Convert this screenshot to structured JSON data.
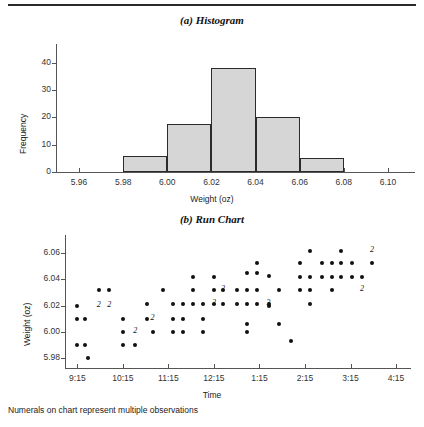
{
  "figure": {
    "caption": "Numerals on chart represent multiple observations"
  },
  "panel_a": {
    "title": "(a) Histogram"
  },
  "panel_b": {
    "title": "(b) Run Chart"
  },
  "chart_data": [
    {
      "type": "bar",
      "title": "(a) Histogram",
      "xlabel": "Weight (oz)",
      "ylabel": "Frequency",
      "xlim": [
        5.95,
        6.11
      ],
      "ylim": [
        0,
        44
      ],
      "xticks": [
        "5.96",
        "5.98",
        "6.00",
        "6.02",
        "6.04",
        "6.06",
        "6.08",
        "6.10"
      ],
      "xtick_values": [
        5.96,
        5.98,
        6.0,
        6.02,
        6.04,
        6.06,
        6.08,
        6.1
      ],
      "yticks": [
        "0",
        "10",
        "20",
        "30",
        "40"
      ],
      "ytick_values": [
        0,
        10,
        20,
        30,
        40
      ],
      "grid": false,
      "legend": "none",
      "bin_edges": [
        5.98,
        6.0,
        6.02,
        6.04,
        6.06,
        6.08
      ],
      "categories": [
        "5.98-6.00",
        "6.00-6.02",
        "6.02-6.04",
        "6.04-6.06",
        "6.06-6.08"
      ],
      "values": [
        6,
        17.5,
        38,
        20,
        5
      ]
    },
    {
      "type": "scatter",
      "title": "(b) Run Chart",
      "xlabel": "Time",
      "ylabel": "Weight (oz)",
      "xlim": [
        9.0,
        16.6
      ],
      "ylim": [
        5.972,
        6.068
      ],
      "xticks": [
        "9:15",
        "10:15",
        "11:15",
        "12:15",
        "1:15",
        "2:15",
        "3:15",
        "4:15"
      ],
      "xtick_values": [
        9.25,
        10.25,
        11.25,
        12.25,
        13.25,
        14.25,
        15.25,
        16.25
      ],
      "yticks": [
        "5.98",
        "6.00",
        "6.02",
        "6.04",
        "6.06"
      ],
      "ytick_values": [
        5.98,
        6.0,
        6.02,
        6.04,
        6.06
      ],
      "grid": false,
      "legend": "none",
      "note": "Numerals on chart represent multiple observations",
      "points": [
        {
          "x": 9.25,
          "y": 6.02
        },
        {
          "x": 9.25,
          "y": 6.01
        },
        {
          "x": 9.25,
          "y": 5.99
        },
        {
          "x": 9.42,
          "y": 6.01
        },
        {
          "x": 9.42,
          "y": 5.99
        },
        {
          "x": 9.48,
          "y": 5.98
        },
        {
          "x": 9.72,
          "y": 6.032
        },
        {
          "x": 9.95,
          "y": 6.032
        },
        {
          "x": 10.25,
          "y": 6.01
        },
        {
          "x": 10.25,
          "y": 6.0
        },
        {
          "x": 10.25,
          "y": 5.99
        },
        {
          "x": 10.52,
          "y": 5.99
        },
        {
          "x": 10.78,
          "y": 6.021
        },
        {
          "x": 10.78,
          "y": 6.01
        },
        {
          "x": 10.9,
          "y": 6.0
        },
        {
          "x": 11.12,
          "y": 6.032
        },
        {
          "x": 11.35,
          "y": 6.021
        },
        {
          "x": 11.35,
          "y": 6.01
        },
        {
          "x": 11.35,
          "y": 6.0
        },
        {
          "x": 11.58,
          "y": 6.021
        },
        {
          "x": 11.58,
          "y": 6.01
        },
        {
          "x": 11.58,
          "y": 6.0
        },
        {
          "x": 11.8,
          "y": 6.042
        },
        {
          "x": 11.8,
          "y": 6.032
        },
        {
          "x": 11.8,
          "y": 6.021
        },
        {
          "x": 12.02,
          "y": 6.021
        },
        {
          "x": 12.02,
          "y": 6.01
        },
        {
          "x": 12.02,
          "y": 6.0
        },
        {
          "x": 12.25,
          "y": 6.042
        },
        {
          "x": 12.25,
          "y": 6.032
        },
        {
          "x": 12.25,
          "y": 6.021
        },
        {
          "x": 12.45,
          "y": 6.032
        },
        {
          "x": 12.45,
          "y": 6.021
        },
        {
          "x": 12.75,
          "y": 6.032
        },
        {
          "x": 12.75,
          "y": 6.021
        },
        {
          "x": 12.98,
          "y": 6.045
        },
        {
          "x": 12.98,
          "y": 6.032
        },
        {
          "x": 12.98,
          "y": 6.021
        },
        {
          "x": 12.98,
          "y": 6.006
        },
        {
          "x": 12.98,
          "y": 6.0
        },
        {
          "x": 13.2,
          "y": 6.053
        },
        {
          "x": 13.2,
          "y": 6.045
        },
        {
          "x": 13.2,
          "y": 6.032
        },
        {
          "x": 13.2,
          "y": 6.021
        },
        {
          "x": 13.45,
          "y": 6.043
        },
        {
          "x": 13.45,
          "y": 6.021
        },
        {
          "x": 13.45,
          "y": 6.02
        },
        {
          "x": 13.68,
          "y": 6.032
        },
        {
          "x": 13.68,
          "y": 6.006
        },
        {
          "x": 13.95,
          "y": 5.993
        },
        {
          "x": 14.15,
          "y": 6.053
        },
        {
          "x": 14.15,
          "y": 6.042
        },
        {
          "x": 14.15,
          "y": 6.032
        },
        {
          "x": 14.35,
          "y": 6.062
        },
        {
          "x": 14.35,
          "y": 6.042
        },
        {
          "x": 14.35,
          "y": 6.032
        },
        {
          "x": 14.35,
          "y": 6.021
        },
        {
          "x": 14.62,
          "y": 6.053
        },
        {
          "x": 14.62,
          "y": 6.042
        },
        {
          "x": 14.85,
          "y": 6.053
        },
        {
          "x": 14.85,
          "y": 6.042
        },
        {
          "x": 14.85,
          "y": 6.032
        },
        {
          "x": 15.05,
          "y": 6.062
        },
        {
          "x": 15.05,
          "y": 6.053
        },
        {
          "x": 15.05,
          "y": 6.042
        },
        {
          "x": 15.28,
          "y": 6.053
        },
        {
          "x": 15.28,
          "y": 6.042
        },
        {
          "x": 15.5,
          "y": 6.042
        },
        {
          "x": 15.72,
          "y": 6.053
        }
      ],
      "numerals": [
        {
          "x": 9.72,
          "y": 6.02,
          "label": "2"
        },
        {
          "x": 9.95,
          "y": 6.02,
          "label": "2"
        },
        {
          "x": 10.9,
          "y": 6.01,
          "label": "2"
        },
        {
          "x": 10.52,
          "y": 6.0,
          "label": "2"
        },
        {
          "x": 12.25,
          "y": 6.021,
          "label": "2"
        },
        {
          "x": 12.45,
          "y": 6.032,
          "label": "2"
        },
        {
          "x": 13.45,
          "y": 6.021,
          "label": "3"
        },
        {
          "x": 15.5,
          "y": 6.032,
          "label": "2"
        },
        {
          "x": 15.72,
          "y": 6.062,
          "label": "2"
        }
      ]
    }
  ]
}
